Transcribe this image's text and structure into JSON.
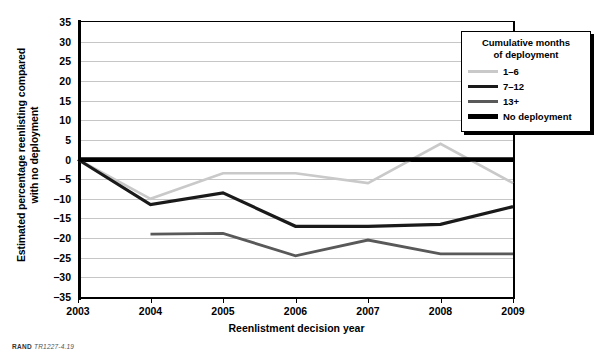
{
  "chart_data": {
    "type": "line",
    "title": "",
    "xlabel": "Reenlistment decision year",
    "ylabel": "Estimated percentage reenlisting compared with no deployment",
    "ylabel_line1": "Estimated percentage reenlisting compared",
    "ylabel_line2": "with no deployment",
    "x": [
      2003,
      2004,
      2005,
      2006,
      2007,
      2008,
      2009
    ],
    "xtick_labels": [
      "2003",
      "2004",
      "2005",
      "2006",
      "2007",
      "2008",
      "2009"
    ],
    "ytick_labels": [
      "35",
      "30",
      "25",
      "20",
      "15",
      "10",
      "5",
      "0",
      "−5",
      "−10",
      "−15",
      "−20",
      "−25",
      "−30",
      "−35"
    ],
    "ytick_values": [
      35,
      30,
      25,
      20,
      15,
      10,
      5,
      0,
      -5,
      -10,
      -15,
      -20,
      -25,
      -30,
      -35
    ],
    "ylim": [
      -35,
      35
    ],
    "xlim": [
      2003,
      2009
    ],
    "grid": true,
    "legend_position": "upper-right",
    "series": [
      {
        "name": "1–6",
        "color": "#c9c9c9",
        "width": 2.6,
        "x": [
          2003,
          2004,
          2005,
          2006,
          2007,
          2008,
          2009
        ],
        "values": [
          0,
          -10,
          -3.5,
          -3.5,
          -6,
          4,
          -6
        ]
      },
      {
        "name": "7–12",
        "color": "#1a1a1a",
        "width": 3.2,
        "x": [
          2003,
          2004,
          2005,
          2006,
          2007,
          2008,
          2009
        ],
        "values": [
          0,
          -11.5,
          -8.5,
          -17,
          -17,
          -16.5,
          -12
        ]
      },
      {
        "name": "13+",
        "color": "#595959",
        "width": 2.8,
        "x": [
          2004,
          2005,
          2006,
          2007,
          2008,
          2009
        ],
        "values": [
          -19,
          -18.8,
          -24.5,
          -20.5,
          -24,
          -24
        ]
      },
      {
        "name": "No deployment",
        "color": "#000000",
        "width": 4.5,
        "x": [
          2003,
          2009
        ],
        "values": [
          0,
          0
        ]
      }
    ]
  },
  "legend": {
    "title_line1": "Cumulative months",
    "title_line2": "of deployment",
    "entries": [
      {
        "label": "1–6",
        "color": "#c9c9c9",
        "thickness": "2.6px"
      },
      {
        "label": "7–12",
        "color": "#1a1a1a",
        "thickness": "3.4px"
      },
      {
        "label": "13+",
        "color": "#595959",
        "thickness": "3px"
      },
      {
        "label": "No deployment",
        "color": "#000000",
        "thickness": "4.6px"
      }
    ]
  },
  "credit": {
    "source": "RAND",
    "id": "TR1227-4.19"
  }
}
